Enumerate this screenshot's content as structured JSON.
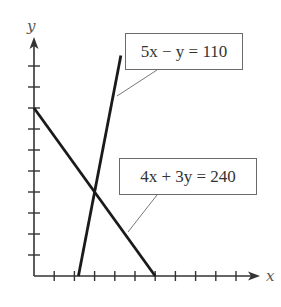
{
  "chart_data": {
    "type": "line",
    "title": "",
    "xlabel": "x",
    "ylabel": "y",
    "xlim": [
      0,
      110
    ],
    "ylim": [
      0,
      110
    ],
    "tick_step": 10,
    "x_ticks": [
      10,
      20,
      30,
      40,
      50,
      60,
      70,
      80,
      90,
      100
    ],
    "y_ticks": [
      10,
      20,
      30,
      40,
      50,
      60,
      70,
      80,
      90,
      100
    ],
    "tick_labels_shown": false,
    "grid": false,
    "series": [
      {
        "name": "5x − y = 110",
        "equation": "5x - y = 110",
        "points": [
          [
            22,
            0
          ],
          [
            43,
            105
          ]
        ]
      },
      {
        "name": "4x + 3y = 240",
        "equation": "4x + 3y = 240",
        "points": [
          [
            0,
            80
          ],
          [
            60,
            0
          ]
        ]
      }
    ],
    "intersection": [
      30,
      40
    ],
    "annotations": [
      {
        "text": "5x − y = 110",
        "target_series": 0
      },
      {
        "text": "4x + 3y = 240",
        "target_series": 1
      }
    ]
  },
  "labels": {
    "x_axis": "x",
    "y_axis": "y",
    "eq1": "5x − y = 110",
    "eq2": "4x + 3y = 240"
  },
  "colors": {
    "axis": "#333333",
    "line": "#1a1a1a",
    "leader": "#777777",
    "box_border": "#6a6a6a",
    "text": "#333333"
  }
}
